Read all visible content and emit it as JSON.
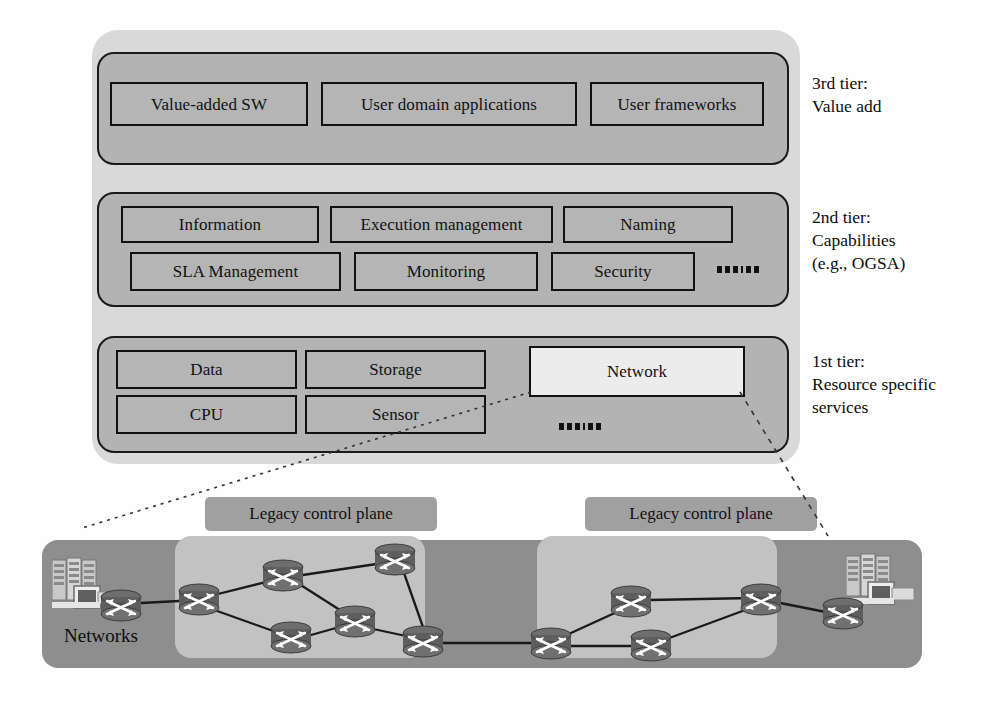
{
  "diagram": {
    "tiers": [
      {
        "id": "tier3",
        "label": "3rd  tier:\nValue add",
        "services": [
          {
            "name": "Value-added SW",
            "highlight": false
          },
          {
            "name": "User domain applications",
            "highlight": false
          },
          {
            "name": "User frameworks",
            "highlight": false
          }
        ],
        "has_ellipsis": false
      },
      {
        "id": "tier2",
        "label": "2nd tier:\nCapabilities\n(e.g., OGSA)",
        "services": [
          {
            "name": "Information",
            "highlight": false
          },
          {
            "name": "Execution management",
            "highlight": false
          },
          {
            "name": "Naming",
            "highlight": false
          },
          {
            "name": "SLA Management",
            "highlight": false
          },
          {
            "name": "Monitoring",
            "highlight": false
          },
          {
            "name": "Security",
            "highlight": false
          }
        ],
        "has_ellipsis": true
      },
      {
        "id": "tier1",
        "label": "1st tier:\nResource specific\nservices",
        "services": [
          {
            "name": "Data",
            "highlight": false
          },
          {
            "name": "Storage",
            "highlight": false
          },
          {
            "name": "Network",
            "highlight": true
          },
          {
            "name": "CPU",
            "highlight": false
          },
          {
            "name": "Sensor",
            "highlight": false
          }
        ],
        "has_ellipsis": true
      }
    ],
    "network_figure": {
      "networks_label": "Networks",
      "control_planes": [
        {
          "label": "Legacy control plane"
        },
        {
          "label": "Legacy control plane"
        }
      ]
    },
    "colors": {
      "page_background": "#fefefe",
      "outer_panel": "#d9d9d9",
      "tier_box_fill": "#b3b3b3",
      "tier_box_border": "#1a1a1a",
      "service_fill": "#b5b5b5",
      "service_highlight_fill": "#ececec",
      "service_border": "#111111",
      "network_panel": "#8e8e8e",
      "control_plane_zone": "#c2c2c2",
      "control_plane_label": "#a0a0a0",
      "link_line": "#1a1a1a",
      "connector_dashes": "#333333"
    }
  }
}
